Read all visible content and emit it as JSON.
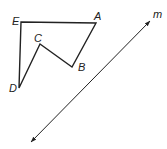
{
  "figure": {
    "polygon": {
      "vertices": [
        {
          "name": "E",
          "x": 21,
          "y": 22,
          "label_x": 12,
          "label_y": 25
        },
        {
          "name": "A",
          "x": 96,
          "y": 23,
          "label_x": 94,
          "label_y": 20
        },
        {
          "name": "B",
          "x": 72,
          "y": 67,
          "label_x": 78,
          "label_y": 71
        },
        {
          "name": "C",
          "x": 40,
          "y": 44,
          "label_x": 34,
          "label_y": 42
        },
        {
          "name": "D",
          "x": 19,
          "y": 88,
          "label_x": 9,
          "label_y": 92
        }
      ]
    },
    "line": {
      "name": "m",
      "x1": 31,
      "y1": 142,
      "x2": 150,
      "y2": 21,
      "label_x": 153,
      "label_y": 18
    },
    "stroke_color": "#222222"
  }
}
